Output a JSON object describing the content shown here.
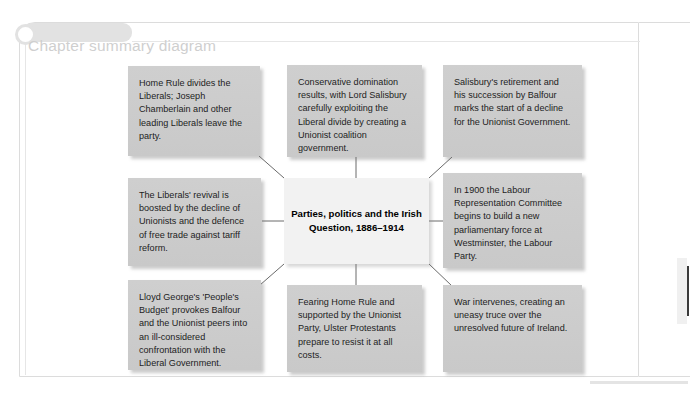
{
  "page": {
    "panel_title": "Chapter summary diagram",
    "colors": {
      "page_background": "#ffffff",
      "frame_border": "#dcdcdc",
      "tab_fill": "#e2e2e2",
      "title_text": "#cfcfcf",
      "node_fill": "#cdcdcd",
      "center_node_fill": "#f2f2f2",
      "node_text": "#1d1d1d",
      "connector_line": "#6a6a6a",
      "edge_mark": "#3a3a3a"
    }
  },
  "diagram": {
    "type": "mind-map",
    "center": {
      "id": "center",
      "label": "Parties, politics and the Irish Question, 1886–1914",
      "line1": "Parties, politics and the",
      "line2": "Irish Question, 1886–1914"
    },
    "nodes": [
      {
        "id": "top-left",
        "position": "top-left",
        "text": "Home Rule divides the Liberals; Joseph Chamberlain and other leading Liberals leave the party."
      },
      {
        "id": "top-center",
        "position": "top-center",
        "text": "Conservative domination results, with Lord Salisbury carefully exploiting the Liberal divide by creating a Unionist coalition government."
      },
      {
        "id": "top-right",
        "position": "top-right",
        "text": "Salisbury's retirement and his succession by Balfour marks the start of a decline for the Unionist Government."
      },
      {
        "id": "middle-left",
        "position": "middle-left",
        "text": "The Liberals' revival is boosted by the decline of Unionists and the defence of free trade against tariff reform."
      },
      {
        "id": "middle-right",
        "position": "middle-right",
        "text": "In 1900 the Labour Representation Committee begins to build a new parliamentary force at Westminster, the Labour Party."
      },
      {
        "id": "bottom-left",
        "position": "bottom-left",
        "text": "Lloyd George's 'People's Budget' provokes Balfour and the Unionist peers into an ill-considered confrontation with the Liberal Government."
      },
      {
        "id": "bottom-center",
        "position": "bottom-center",
        "text": "Fearing Home Rule and supported by the Unionist Party, Ulster Protestants prepare to resist it at all costs."
      },
      {
        "id": "bottom-right",
        "position": "bottom-right",
        "text": "War intervenes, creating an uneasy truce over the unresolved future of Ireland."
      }
    ],
    "connector_count": 8
  }
}
